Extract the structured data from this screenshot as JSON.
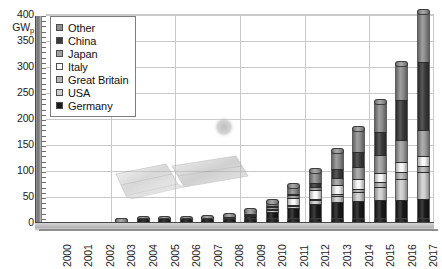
{
  "chart_data": {
    "type": "bar",
    "subtype": "stacked-column-3d-cylinder",
    "title": "",
    "subtitle": "",
    "xlabel": "",
    "ylabel": "GWp",
    "ylim": [
      0,
      400
    ],
    "yticks": [
      0,
      50,
      100,
      150,
      200,
      250,
      300,
      350,
      400
    ],
    "ytick_labels": [
      "0",
      "50",
      "100",
      "150",
      "200",
      "250",
      "300",
      "350",
      "400"
    ],
    "y_minor_tick_step": 10,
    "grid": "horizontal-and-vertical",
    "legend_position": "top-left-inside",
    "categories": [
      "2000",
      "2001",
      "2002",
      "2003",
      "2004",
      "2005",
      "2006",
      "2007",
      "2008",
      "2009",
      "2010",
      "2011",
      "2012",
      "2013",
      "2014",
      "2015",
      "2016",
      "2017"
    ],
    "stack_order_bottom_to_top": [
      "Germany",
      "USA",
      "Great Britain",
      "Italy",
      "Japan",
      "China",
      "Other"
    ],
    "series": [
      {
        "name": "Germany",
        "color": "#1a1a1a",
        "values": [
          0.1,
          0.2,
          0.3,
          0.4,
          1.1,
          2.1,
          2.9,
          4.2,
          6.1,
          10.6,
          18.0,
          25.4,
          33.0,
          36.3,
          38.2,
          39.7,
          41.2,
          42.4
        ]
      },
      {
        "name": "USA",
        "color": "#cfcfcf",
        "values": [
          0.1,
          0.2,
          0.2,
          0.3,
          0.4,
          0.5,
          0.6,
          0.8,
          1.2,
          1.6,
          2.5,
          4.4,
          7.7,
          12.1,
          18.3,
          25.6,
          40.3,
          51.0
        ]
      },
      {
        "name": "Great Britain",
        "color": "#b7b7b7",
        "values": [
          0.0,
          0.0,
          0.0,
          0.0,
          0.0,
          0.0,
          0.0,
          0.0,
          0.0,
          0.0,
          0.1,
          1.0,
          1.8,
          2.9,
          5.5,
          9.1,
          11.9,
          12.8
        ]
      },
      {
        "name": "Italy",
        "color": "#f7f7f7",
        "values": [
          0.0,
          0.0,
          0.0,
          0.0,
          0.0,
          0.0,
          0.0,
          0.1,
          0.5,
          1.2,
          3.5,
          12.8,
          16.4,
          18.1,
          18.6,
          18.9,
          19.3,
          19.7
        ]
      },
      {
        "name": "Japan",
        "color": "#a0a0a0",
        "values": [
          0.3,
          0.5,
          0.6,
          0.9,
          1.1,
          1.4,
          1.7,
          1.9,
          2.1,
          2.6,
          3.6,
          4.9,
          6.6,
          13.6,
          23.3,
          34.2,
          42.8,
          49.0
        ]
      },
      {
        "name": "China",
        "color": "#3b3b3b",
        "values": [
          0.0,
          0.0,
          0.0,
          0.0,
          0.1,
          0.1,
          0.1,
          0.1,
          0.2,
          0.3,
          0.9,
          3.3,
          7.0,
          17.7,
          28.2,
          43.5,
          77.8,
          131.0
        ]
      },
      {
        "name": "Other",
        "color": "#8e8e8e",
        "values": [
          0.3,
          0.4,
          0.6,
          0.8,
          1.0,
          1.4,
          1.9,
          2.8,
          4.0,
          6.7,
          11.4,
          18.2,
          27.5,
          37.3,
          48.9,
          61.0,
          71.7,
          99.1
        ]
      }
    ],
    "totals": [
      0.8,
      1.3,
      1.7,
      2.4,
      3.7,
      5.5,
      7.2,
      9.9,
      14.1,
      23.0,
      40.0,
      70.0,
      100.0,
      138.0,
      181.0,
      232.0,
      305.0,
      405.0
    ]
  },
  "legend": {
    "items": [
      {
        "label": "Other",
        "color": "#8e8e8e"
      },
      {
        "label": "China",
        "color": "#3b3b3b"
      },
      {
        "label": "Japan",
        "color": "#a0a0a0"
      },
      {
        "label": "Italy",
        "color": "#f7f7f7"
      },
      {
        "label": "Great Britain",
        "color": "#b7b7b7"
      },
      {
        "label": "USA",
        "color": "#cfcfcf"
      },
      {
        "label": "Germany",
        "color": "#1a1a1a"
      }
    ]
  },
  "axes": {
    "y_unit_main": "GW",
    "y_unit_sub": "p"
  },
  "colors": {
    "gridline": "#c9c9c9",
    "axis_wall": "#6f6f6f",
    "floor": "#b4b4b4",
    "text": "#1c1c1c",
    "background": "#ffffff"
  }
}
